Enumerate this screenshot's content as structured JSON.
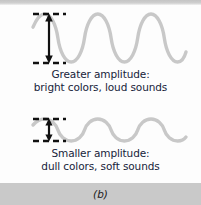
{
  "figure": {
    "label": "(b)",
    "background": "#fdfdfd",
    "band_color": "#c9c9c9",
    "wave_color": "#c8c8c8",
    "annotation_color": "#111111",
    "text_color": "#17233a"
  },
  "panels": [
    {
      "id": "large",
      "caption_line1": "Greater amplitude:",
      "caption_line2": "bright colors, loud sounds",
      "amplitude_label": "greater",
      "wave": {
        "cycles": 2,
        "amplitude_px": 25,
        "baseline_y": 30,
        "x_start": 33,
        "x_end": 186
      },
      "arrow": {
        "x": 49,
        "y_top": 6,
        "y_bottom": 55,
        "double_headed": true
      },
      "dashes": {
        "x_start": 33,
        "x_end": 66,
        "y_top": 6,
        "y_bottom": 55
      }
    },
    {
      "id": "small",
      "caption_line1": "Smaller amplitude:",
      "caption_line2": "dull colors, soft sounds",
      "amplitude_label": "smaller",
      "wave": {
        "cycles": 2,
        "amplitude_px": 11,
        "baseline_y": 20,
        "x_start": 33,
        "x_end": 186
      },
      "arrow": {
        "x": 49,
        "y_top": 9,
        "y_bottom": 30,
        "double_headed": true
      },
      "dashes": {
        "x_start": 33,
        "x_end": 66,
        "y_top": 9,
        "y_bottom": 30
      }
    }
  ]
}
